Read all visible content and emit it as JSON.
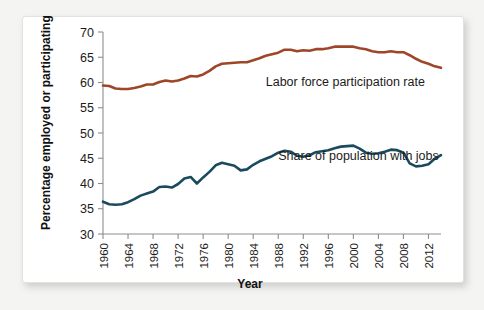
{
  "card": {
    "background": "#ffffff",
    "page_background": "#f4f4f2"
  },
  "chart_data": {
    "type": "line",
    "title": "",
    "xlabel": "Year",
    "ylabel": "Percentage employed or participating",
    "xlim": [
      1960,
      2014
    ],
    "ylim": [
      30,
      70
    ],
    "ytick_step": 5,
    "xtick_step": 4,
    "grid": false,
    "legend": "inline-annotations",
    "yticks": [
      30,
      35,
      40,
      45,
      50,
      55,
      60,
      65,
      70
    ],
    "xticks": [
      1960,
      1964,
      1968,
      1972,
      1976,
      1980,
      1984,
      1988,
      1992,
      1996,
      2000,
      2004,
      2008,
      2012
    ],
    "x": [
      1960,
      1961,
      1962,
      1963,
      1964,
      1965,
      1966,
      1967,
      1968,
      1969,
      1970,
      1971,
      1972,
      1973,
      1974,
      1975,
      1976,
      1977,
      1978,
      1979,
      1980,
      1981,
      1982,
      1983,
      1984,
      1985,
      1986,
      1987,
      1988,
      1989,
      1990,
      1991,
      1992,
      1993,
      1994,
      1995,
      1996,
      1997,
      1998,
      1999,
      2000,
      2001,
      2002,
      2003,
      2004,
      2005,
      2006,
      2007,
      2008,
      2009,
      2010,
      2011,
      2012,
      2013,
      2014
    ],
    "series": [
      {
        "name": "Labor force participation rate",
        "color": "#9e4628",
        "label_x": 1986,
        "label_y": 59.4,
        "values": [
          59.4,
          59.3,
          58.8,
          58.7,
          58.7,
          58.9,
          59.2,
          59.6,
          59.6,
          60.1,
          60.4,
          60.2,
          60.4,
          60.8,
          61.3,
          61.2,
          61.6,
          62.3,
          63.2,
          63.7,
          63.8,
          63.9,
          64.0,
          64.0,
          64.4,
          64.8,
          65.3,
          65.6,
          65.9,
          66.5,
          66.5,
          66.2,
          66.4,
          66.3,
          66.6,
          66.6,
          66.8,
          67.1,
          67.1,
          67.1,
          67.1,
          66.8,
          66.6,
          66.2,
          66.0,
          66.0,
          66.2,
          66.0,
          66.0,
          65.4,
          64.7,
          64.1,
          63.7,
          63.2,
          62.9
        ]
      },
      {
        "name": "Share of population with jobs",
        "color": "#1b4a5e",
        "label_x": 1988,
        "label_y": 44.6,
        "values": [
          36.4,
          35.9,
          35.8,
          35.9,
          36.3,
          36.9,
          37.6,
          38.0,
          38.4,
          39.3,
          39.4,
          39.2,
          39.9,
          41.0,
          41.3,
          40.0,
          41.2,
          42.3,
          43.6,
          44.1,
          43.8,
          43.5,
          42.6,
          42.8,
          43.7,
          44.4,
          44.9,
          45.4,
          46.1,
          46.5,
          46.3,
          45.5,
          45.3,
          45.6,
          46.2,
          46.4,
          46.6,
          47.0,
          47.3,
          47.4,
          47.5,
          46.9,
          46.1,
          45.9,
          46.0,
          46.3,
          46.7,
          46.6,
          46.1,
          44.0,
          43.4,
          43.5,
          43.8,
          44.9,
          45.6
        ]
      }
    ]
  },
  "labels": {
    "y_axis_title": "Percentage employed or participating",
    "x_axis_title": "Year",
    "series_one": "Labor force participation rate",
    "series_two": "Share of population with jobs"
  }
}
